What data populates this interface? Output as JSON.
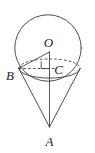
{
  "figure": {
    "canvas": {
      "width": 95,
      "height": 153,
      "background": "#ffffff"
    },
    "stroke_color": "#3b3b3b",
    "label_color": "#1a1a1a",
    "labels": {
      "sphere_center": "O",
      "base_edge_point": "B",
      "base_center": "C",
      "apex": "A"
    },
    "points": {
      "O": {
        "x": 49.5,
        "y": 52.0
      },
      "B": {
        "x": 18.5,
        "y": 68.5
      },
      "C": {
        "x": 49.5,
        "y": 68.5
      },
      "A": {
        "x": 49.5,
        "y": 127.0
      }
    },
    "label_positions": {
      "O": {
        "x": 48.5,
        "y": 46.5
      },
      "B": {
        "x": 10.0,
        "y": 80.0
      },
      "C": {
        "x": 58.5,
        "y": 73.5
      },
      "A": {
        "x": 49.5,
        "y": 146.0
      }
    },
    "circle": {
      "cx": 48.0,
      "cy": 48.0,
      "r": 33.2
    },
    "base_ellipse": {
      "cx": 49.5,
      "cy": 68.5,
      "rx": 30.6,
      "ry": 9.6
    },
    "right_angle_mark": {
      "x": 41.0,
      "y": 61.8,
      "size": 6.8
    },
    "elements": [
      "sphere-outline-circle",
      "cone-base-ellipse-front",
      "cone-base-ellipse-back",
      "cone-left-slant-edge",
      "cone-right-slant-edge",
      "cone-axis-line",
      "radius-segment-OB",
      "radius-segment-BC",
      "right-angle-marker"
    ]
  }
}
